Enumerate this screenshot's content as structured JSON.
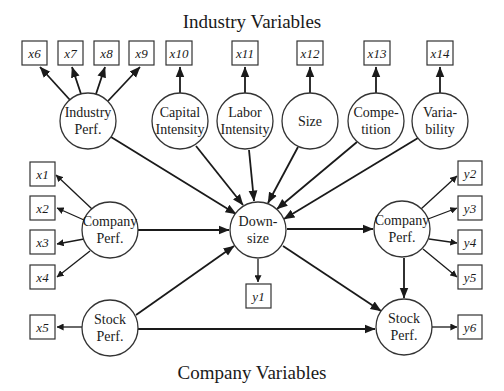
{
  "titles": {
    "top": "Industry Variables",
    "bottom": "Company Variables"
  },
  "latent_nodes": {
    "industry_perf": {
      "line1": "Industry",
      "line2": "Perf."
    },
    "capital_intensity": {
      "line1": "Capital",
      "line2": "Intensity"
    },
    "labor_intensity": {
      "line1": "Labor",
      "line2": "Intensity"
    },
    "size": {
      "line1": "Size"
    },
    "competition": {
      "line1": "Compe-",
      "line2": "tition"
    },
    "variability": {
      "line1": "Varia-",
      "line2": "bility"
    },
    "company_perf_pre": {
      "line1": "Company",
      "line2": "Perf."
    },
    "stock_perf_pre": {
      "line1": "Stock",
      "line2": "Perf."
    },
    "downsize": {
      "line1": "Down-",
      "line2": "size"
    },
    "company_perf_post": {
      "line1": "Company",
      "line2": "Perf."
    },
    "stock_perf_post": {
      "line1": "Stock",
      "line2": "Perf."
    }
  },
  "indicators": {
    "x1": "x1",
    "x2": "x2",
    "x3": "x3",
    "x4": "x4",
    "x5": "x5",
    "x6": "x6",
    "x7": "x7",
    "x8": "x8",
    "x9": "x9",
    "x10": "x10",
    "x11": "x11",
    "x12": "x12",
    "x13": "x13",
    "x14": "x14",
    "y1": "y1",
    "y2": "y2",
    "y3": "y3",
    "y4": "y4",
    "y5": "y5",
    "y6": "y6"
  },
  "edges": [
    {
      "from": "Industry Perf.",
      "to": [
        "x6",
        "x7",
        "x8",
        "x9"
      ]
    },
    {
      "from": "Capital Intensity",
      "to": [
        "x10"
      ]
    },
    {
      "from": "Labor Intensity",
      "to": [
        "x11"
      ]
    },
    {
      "from": "Size",
      "to": [
        "x12"
      ]
    },
    {
      "from": "Competition",
      "to": [
        "x13"
      ]
    },
    {
      "from": "Variability",
      "to": [
        "x14"
      ]
    },
    {
      "from": "Company Perf. (pre)",
      "to": [
        "x1",
        "x2",
        "x3",
        "x4",
        "Downsize"
      ]
    },
    {
      "from": "Stock Perf. (pre)",
      "to": [
        "x5",
        "Downsize",
        "Stock Perf. (post)"
      ]
    },
    {
      "from": "Industry Perf.",
      "to": [
        "Downsize"
      ]
    },
    {
      "from": "Capital Intensity",
      "to": [
        "Downsize"
      ]
    },
    {
      "from": "Labor Intensity",
      "to": [
        "Downsize"
      ]
    },
    {
      "from": "Size",
      "to": [
        "Downsize"
      ]
    },
    {
      "from": "Competition",
      "to": [
        "Downsize"
      ]
    },
    {
      "from": "Variability",
      "to": [
        "Downsize"
      ]
    },
    {
      "from": "Downsize",
      "to": [
        "y1",
        "Company Perf. (post)",
        "Stock Perf. (post)"
      ]
    },
    {
      "from": "Company Perf. (post)",
      "to": [
        "y2",
        "y3",
        "y4",
        "y5",
        "Stock Perf. (post)"
      ]
    },
    {
      "from": "Stock Perf. (post)",
      "to": [
        "y6"
      ]
    }
  ]
}
